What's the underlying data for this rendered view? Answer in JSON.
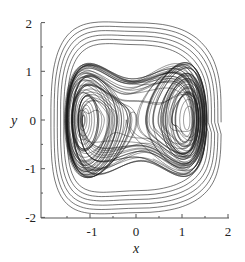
{
  "chart_data": {
    "type": "line",
    "title": "",
    "xlabel": "x",
    "ylabel": "y",
    "xlim": [
      -2,
      2
    ],
    "ylim": [
      -2,
      2
    ],
    "x_ticks": [
      "-1",
      "0",
      "1",
      "2"
    ],
    "y_ticks": [
      "2",
      "1",
      "0",
      "-1",
      "-2"
    ],
    "grid": false,
    "legend": null,
    "series": [
      {
        "name": "phase trajectory (chaotic Duffing-type attractor)",
        "color": "#1a1a1a",
        "description": "Dense trajectory with two lobes centered near (-1,0) and (1,0), outer loops reaching |y|≈1.9, |x|≈1.9",
        "sample_points": [
          [
            -1.1,
            0
          ],
          [
            1.1,
            0
          ],
          [
            -1.5,
            0.8
          ],
          [
            1.5,
            -0.8
          ],
          [
            0,
            1.6
          ],
          [
            0,
            -1.6
          ],
          [
            0.3,
            2.0
          ],
          [
            -0.9,
            -2.0
          ]
        ]
      }
    ]
  },
  "colors": {
    "line": "#1a1a1a",
    "axis": "#555555",
    "background": "#ffffff"
  }
}
